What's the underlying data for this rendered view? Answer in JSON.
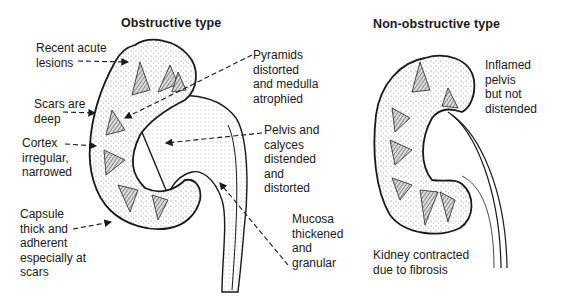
{
  "panels": {
    "obstructive": {
      "title": "Obstructive type",
      "labels": {
        "recent_acute": "Recent acute\nlesions",
        "scars_deep": "Scars are\ndeep",
        "cortex": "Cortex\nirregular,\nnarrowed",
        "capsule": "Capsule\nthick and\nadherent\nespecially at\nscars",
        "pyramids": "Pyramids\ndistorted\nand medulla\natrophied",
        "pelvis": "Pelvis and\ncalyces\ndistended\nand\ndistorted",
        "mucosa": "Mucosa\nthickened\nand\ngranular"
      }
    },
    "non_obstructive": {
      "title": "Non-obstructive type",
      "labels": {
        "inflamed": "Inflamed\npelvis\nbut not\ndistended",
        "contracted": "Kidney contracted\ndue to fibrosis"
      }
    }
  },
  "colors": {
    "ink": "#1a1a1a",
    "stipple": "#9a9a9a",
    "background": "#ffffff"
  }
}
